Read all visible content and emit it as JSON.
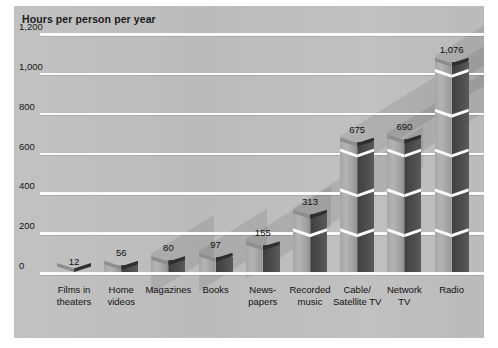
{
  "chart_data": {
    "type": "bar",
    "title": "Hours per person per year",
    "xlabel": "",
    "ylabel": "Hours per person per year",
    "ylim": [
      0,
      1200
    ],
    "ytick_step": 200,
    "ytick_labels": [
      "0",
      "200",
      "400",
      "600",
      "800",
      "1,000",
      "1,200"
    ],
    "ytick_values": [
      0,
      200,
      400,
      600,
      800,
      1000,
      1200
    ],
    "grid": true,
    "legend": "none",
    "style": "3d-prism-bars",
    "categories": [
      "Films in\ntheaters",
      "Home\nvideos",
      "Magazines",
      "Books",
      "News-\npapers",
      "Recorded\nmusic",
      "Cable/\nSatellite TV",
      "Network\nTV",
      "Radio"
    ],
    "values": [
      12,
      56,
      80,
      97,
      155,
      313,
      675,
      690,
      1076
    ],
    "value_labels": [
      "12",
      "56",
      "80",
      "97",
      "155",
      "313",
      "675",
      "690",
      "1,076"
    ]
  },
  "colors": {
    "panel_background": "#bebebe",
    "gridline": "#fbfbfb",
    "bar_light_face": "#b4b4b4",
    "bar_dark_face": "#4a4a4a",
    "bar_top_light": "#8d8d8d",
    "bar_top_dark": "#2e2e2e",
    "text": "#111111",
    "page_background": "#ffffff"
  }
}
